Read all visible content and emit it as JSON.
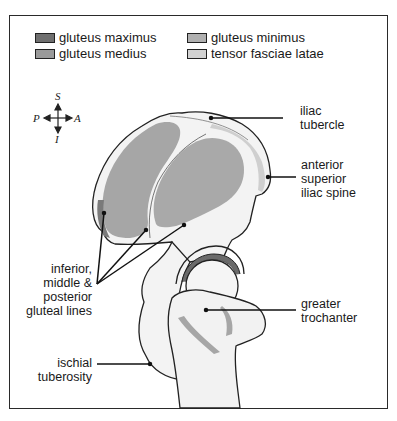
{
  "legend": {
    "items": [
      {
        "label": "gluteus maximus",
        "color": "#6f6f6f"
      },
      {
        "label": "gluteus medius",
        "color": "#9a9a9a"
      },
      {
        "label": "gluteus minimus",
        "color": "#b0b0b0"
      },
      {
        "label": "tensor fasciae latae",
        "color": "#d2d2d2"
      }
    ]
  },
  "compass": {
    "superior": "S",
    "inferior": "I",
    "posterior": "P",
    "anterior": "A"
  },
  "labels": {
    "iliac_tubercle": [
      "iliac",
      "tubercle"
    ],
    "asis": [
      "anterior",
      "superior",
      "iliac spine"
    ],
    "gluteal_lines": [
      "inferior,",
      "middle &",
      "posterior",
      "gluteal lines"
    ],
    "greater_trochanter": [
      "greater",
      "trochanter"
    ],
    "ischial_tuberosity": [
      "ischial",
      "tuberosity"
    ]
  },
  "colors": {
    "bone": "#f2f2f2",
    "outline": "#222222",
    "muscle_medius": "#a6a6a6",
    "muscle_maximus": "#7a7a7a",
    "muscle_minimus": "#b8b8b8",
    "tfl": "#d0d0d0"
  }
}
